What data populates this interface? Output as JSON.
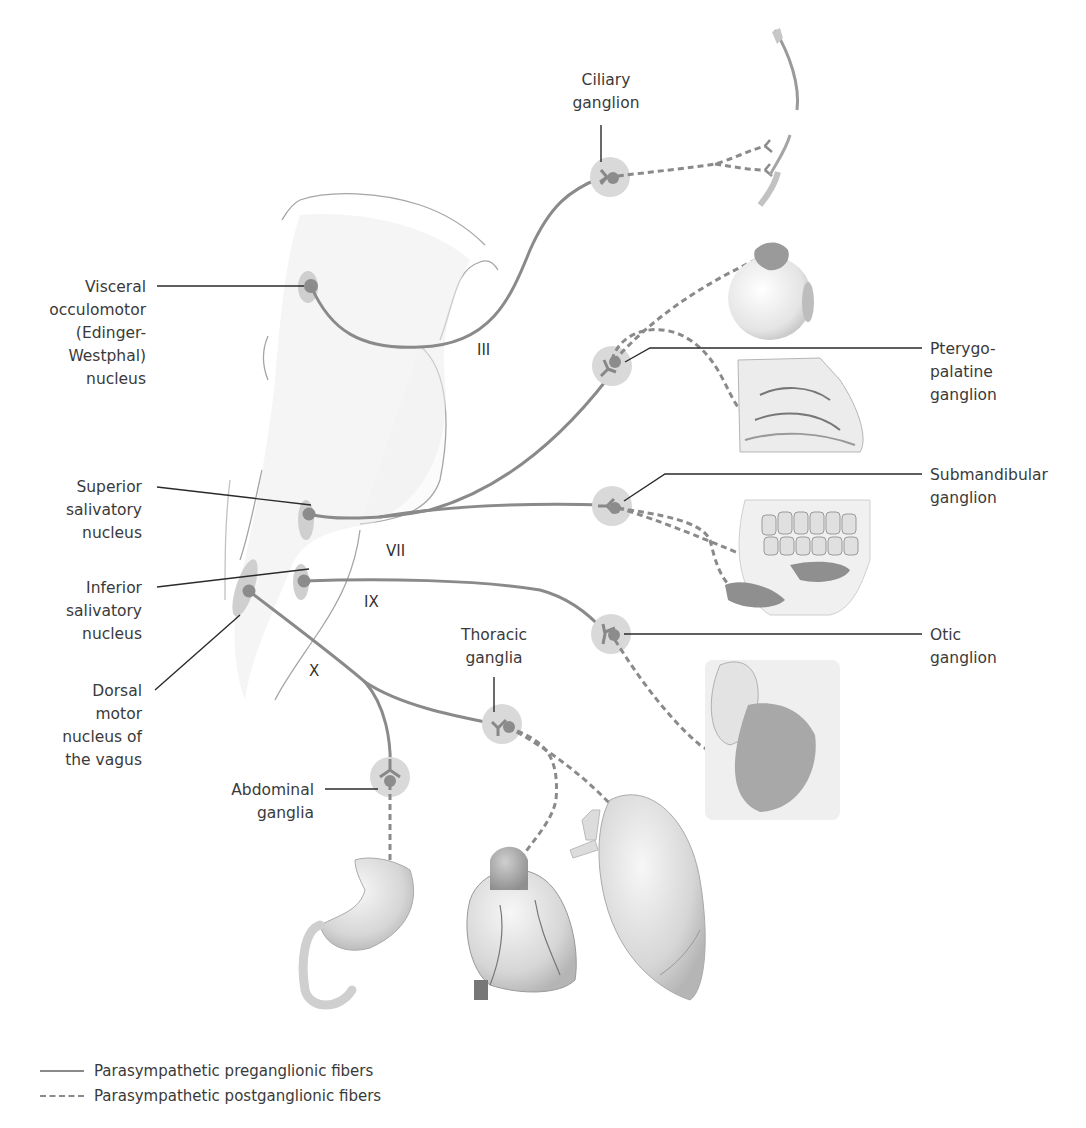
{
  "figure": {
    "colors": {
      "preganglionic": "#8a8a8a",
      "postganglionic": "#8a8a8a",
      "ganglion_halo": "#d9d9d9",
      "ganglion_body": "#8c8c8c",
      "nucleus_halo": "#c9c9c9",
      "leader_line": "#222222",
      "brainstem_outline": "#9a9a9a"
    }
  },
  "nuclei": [
    {
      "id": "edinger",
      "lines": [
        "Visceral",
        "occulomotor",
        "(Edinger-",
        "Westphal)",
        "nucleus"
      ]
    },
    {
      "id": "superior_salivatory",
      "lines": [
        "Superior",
        "salivatory",
        "nucleus"
      ]
    },
    {
      "id": "inferior_salivatory",
      "lines": [
        "Inferior",
        "salivatory",
        "nucleus"
      ]
    },
    {
      "id": "dorsal_vagus",
      "lines": [
        "Dorsal",
        "motor",
        "nucleus of",
        "the vagus"
      ]
    }
  ],
  "ganglia": [
    {
      "id": "ciliary",
      "lines": [
        "Ciliary",
        "ganglion"
      ]
    },
    {
      "id": "pterygopalatine",
      "lines": [
        "Pterygo-",
        "palatine",
        "ganglion"
      ]
    },
    {
      "id": "submandibular",
      "lines": [
        "Submandibular",
        "ganglion"
      ]
    },
    {
      "id": "otic",
      "lines": [
        "Otic",
        "ganglion"
      ]
    },
    {
      "id": "thoracic",
      "lines": [
        "Thoracic",
        "ganglia"
      ]
    },
    {
      "id": "abdominal",
      "lines": [
        "Abdominal",
        "ganglia"
      ]
    }
  ],
  "cranial_nerves": {
    "III": "III",
    "VII": "VII",
    "IX": "IX",
    "X": "X"
  },
  "target_organs": [
    "eye-ciliary-muscle",
    "lacrimal-gland",
    "nasal-cavity",
    "salivary-glands-mandible",
    "parotid-gland",
    "stomach",
    "heart",
    "lung"
  ],
  "legend": {
    "items": [
      {
        "style": "solid",
        "label": "Parasympathetic preganglionic fibers"
      },
      {
        "style": "dashed",
        "label": "Parasympathetic postganglionic fibers"
      }
    ]
  }
}
